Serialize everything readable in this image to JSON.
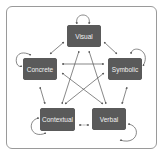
{
  "diagram": {
    "type": "network",
    "nodes": [
      {
        "id": "visual",
        "label": "Visual"
      },
      {
        "id": "concrete",
        "label": "Concrete"
      },
      {
        "id": "symbolic",
        "label": "Symbolic"
      },
      {
        "id": "contextual",
        "label": "Contextual"
      },
      {
        "id": "verbal",
        "label": "Verbal"
      }
    ],
    "edges": [
      {
        "from": "visual",
        "to": "visual",
        "style": "self-loop",
        "direction": "bidirectional"
      },
      {
        "from": "concrete",
        "to": "concrete",
        "style": "self-loop",
        "direction": "bidirectional"
      },
      {
        "from": "symbolic",
        "to": "symbolic",
        "style": "self-loop",
        "direction": "bidirectional"
      },
      {
        "from": "contextual",
        "to": "contextual",
        "style": "self-loop",
        "direction": "bidirectional"
      },
      {
        "from": "verbal",
        "to": "verbal",
        "style": "self-loop",
        "direction": "bidirectional"
      },
      {
        "from": "visual",
        "to": "concrete",
        "direction": "bidirectional"
      },
      {
        "from": "visual",
        "to": "symbolic",
        "direction": "bidirectional"
      },
      {
        "from": "concrete",
        "to": "contextual",
        "direction": "bidirectional"
      },
      {
        "from": "symbolic",
        "to": "verbal",
        "direction": "bidirectional"
      },
      {
        "from": "contextual",
        "to": "verbal",
        "direction": "bidirectional",
        "style": "dashed"
      },
      {
        "from": "concrete",
        "to": "symbolic",
        "direction": "bidirectional"
      },
      {
        "from": "visual",
        "to": "contextual",
        "direction": "bidirectional"
      },
      {
        "from": "visual",
        "to": "verbal",
        "direction": "bidirectional"
      },
      {
        "from": "concrete",
        "to": "verbal",
        "direction": "bidirectional"
      },
      {
        "from": "symbolic",
        "to": "contextual",
        "direction": "bidirectional"
      }
    ],
    "colors": {
      "node_fill": "#5a5a5a",
      "node_text": "#f2f2f2",
      "edge": "#555555",
      "frame": "#9a9a9a"
    }
  }
}
